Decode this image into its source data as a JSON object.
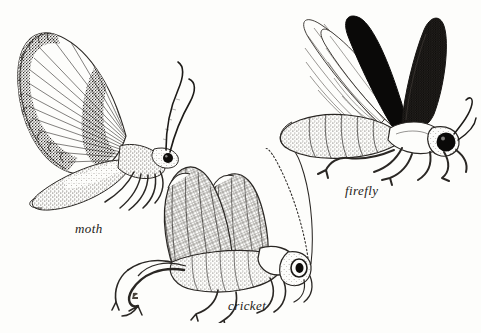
{
  "plate": {
    "title": "insect plate",
    "style": "pen-and-ink stipple engraving",
    "background_color": "#fdfdfb",
    "ink_color": "#1d1b18",
    "width": 481,
    "height": 333
  },
  "figures": [
    {
      "id": "moth",
      "label": "moth",
      "position": "upper-left",
      "description": "moth in side view with large banded forewing raised, dark stippled bands alternating with pale radiating veins, stippled hindwing and abdomen below, two long curved antennae and a solid black eye",
      "features": [
        "banded forewing",
        "radiating veins",
        "stippled hindwing",
        "curved antennae",
        "black eye",
        "legs"
      ],
      "label_position": {
        "x": 75,
        "y": 221
      }
    },
    {
      "id": "cricket",
      "label": "cricket",
      "position": "bottom-center",
      "description": "cricket in side view with raised cross-hatched wings, segmented stippled body, long jointed hind legs and two very long fine antennae sweeping up and to the right, ringed eye",
      "features": [
        "raised venated wings",
        "cross-hatch venation",
        "long hind legs",
        "long antennae",
        "ringed eye",
        "pronotum"
      ],
      "label_position": {
        "x": 228,
        "y": 298
      }
    },
    {
      "id": "firefly",
      "label": "firefly",
      "position": "upper-right",
      "description": "firefly in side view with two dark elytra raised in a V, the left one solid black and the right one stippled dark grey, pale translucent hindwings fanned behind, segmented stippled abdomen, six legs and a large black eye",
      "features": [
        "V-shaped elytra",
        "solid black elytron",
        "stippled elytron",
        "translucent hindwings",
        "segmented abdomen",
        "black eye",
        "antennae",
        "legs"
      ],
      "label_position": {
        "x": 345,
        "y": 183
      }
    }
  ],
  "marks": [
    {
      "id": "artist-mark",
      "description": "small ink monogram mark below cricket hind leg",
      "x": 133,
      "y": 296
    }
  ]
}
